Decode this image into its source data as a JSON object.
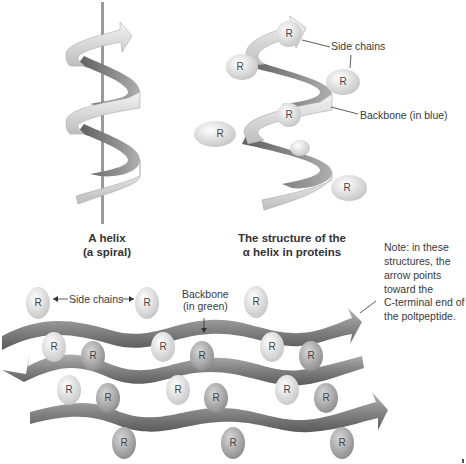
{
  "helix_simple": {
    "caption_line1": "A helix",
    "caption_line2": "(a spiral)"
  },
  "alpha_helix": {
    "caption_line1": "The structure of the",
    "caption_line2": "α helix in proteins",
    "label_side_chains": "Side chains",
    "label_backbone": "Backbone (in blue)",
    "side_chain_symbol": "R"
  },
  "beta_sheet": {
    "label_side_chains": "Side chains",
    "label_backbone_line1": "Backbone",
    "label_backbone_line2": "(in green)",
    "side_chain_symbol": "R"
  },
  "note": {
    "lines": [
      "Note: in these",
      "structures, the",
      "arrow points",
      "toward the",
      "C-terminal end of",
      "the poltpeptide."
    ]
  },
  "colors": {
    "ribbon_light": "#e8e8e8",
    "ribbon_dark": "#7a7a7a",
    "sidechain": "#dcdcdc",
    "text": "#3a3a3a"
  }
}
